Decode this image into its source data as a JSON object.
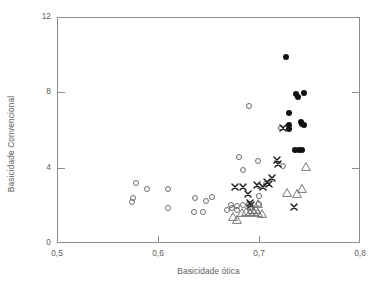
{
  "chart_data": {
    "type": "scatter",
    "title": "",
    "xlabel": "Basicidade ótica",
    "ylabel": "Basicidade Convencional",
    "xlim": [
      0.5,
      0.8
    ],
    "ylim": [
      0,
      12
    ],
    "xticks": [
      "0,5",
      "0,6",
      "0,7",
      "0,8"
    ],
    "xtick_values": [
      0.5,
      0.6,
      0.7,
      0.8
    ],
    "yticks": [
      "0",
      "4",
      "8",
      "12"
    ],
    "ytick_values": [
      0,
      4,
      8,
      12
    ],
    "grid": false,
    "legend": "none",
    "frame": "box",
    "series": [
      {
        "name": "open-circle",
        "marker": "open-circle",
        "color": "#6b6b6b",
        "points": [
          [
            0.578,
            3.2
          ],
          [
            0.575,
            2.4
          ],
          [
            0.574,
            2.2
          ],
          [
            0.589,
            2.85
          ],
          [
            0.61,
            2.85
          ],
          [
            0.61,
            1.85
          ],
          [
            0.637,
            2.4
          ],
          [
            0.636,
            1.65
          ],
          [
            0.645,
            1.65
          ],
          [
            0.648,
            2.25
          ],
          [
            0.653,
            2.45
          ],
          [
            0.668,
            1.75
          ],
          [
            0.673,
            1.85
          ],
          [
            0.678,
            1.95
          ],
          [
            0.672,
            2.0
          ],
          [
            0.678,
            1.75
          ],
          [
            0.684,
            2.0
          ],
          [
            0.69,
            2.05
          ],
          [
            0.691,
            1.85
          ],
          [
            0.7,
            2.05
          ],
          [
            0.68,
            4.55
          ],
          [
            0.684,
            3.9
          ],
          [
            0.69,
            7.3
          ],
          [
            0.699,
            4.35
          ],
          [
            0.7,
            2.5
          ],
          [
            0.7,
            3.05
          ],
          [
            0.707,
            3.15
          ],
          [
            0.724,
            4.1
          ],
          [
            0.722,
            6.1
          ]
        ]
      },
      {
        "name": "filled-circle",
        "marker": "filled-circle",
        "color": "#111111",
        "points": [
          [
            0.727,
            9.9
          ],
          [
            0.737,
            7.9
          ],
          [
            0.739,
            7.75
          ],
          [
            0.745,
            7.95
          ],
          [
            0.73,
            6.9
          ],
          [
            0.73,
            6.25
          ],
          [
            0.73,
            6.05
          ],
          [
            0.742,
            6.4
          ],
          [
            0.743,
            6.3
          ],
          [
            0.745,
            6.25
          ],
          [
            0.736,
            4.95
          ],
          [
            0.74,
            4.95
          ],
          [
            0.743,
            4.95
          ]
        ]
      },
      {
        "name": "cross",
        "marker": "cross",
        "color": "#222222",
        "points": [
          [
            0.676,
            3.0
          ],
          [
            0.684,
            3.0
          ],
          [
            0.689,
            2.6
          ],
          [
            0.691,
            2.1
          ],
          [
            0.692,
            2.0
          ],
          [
            0.698,
            3.1
          ],
          [
            0.704,
            3.0
          ],
          [
            0.708,
            3.25
          ],
          [
            0.71,
            3.15
          ],
          [
            0.713,
            3.45
          ],
          [
            0.718,
            4.4
          ],
          [
            0.719,
            4.2
          ],
          [
            0.724,
            6.1
          ],
          [
            0.735,
            1.9
          ]
        ]
      },
      {
        "name": "open-triangle",
        "marker": "open-triangle",
        "color": "#6b6b6b",
        "points": [
          [
            0.669,
            1.35
          ],
          [
            0.673,
            1.2
          ],
          [
            0.678,
            1.55
          ],
          [
            0.682,
            1.6
          ],
          [
            0.686,
            1.55
          ],
          [
            0.69,
            1.6
          ],
          [
            0.694,
            1.55
          ],
          [
            0.698,
            1.5
          ],
          [
            0.694,
            2.05
          ],
          [
            0.688,
            1.75
          ],
          [
            0.692,
            1.75
          ],
          [
            0.723,
            2.65
          ],
          [
            0.733,
            2.6
          ],
          [
            0.738,
            2.85
          ],
          [
            0.742,
            4.0
          ]
        ]
      }
    ]
  },
  "axis": {
    "y_title": "Basicidade Convencional",
    "x_title": "Basicidade ótica"
  }
}
